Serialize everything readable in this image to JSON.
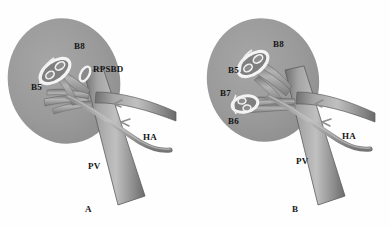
{
  "figure": {
    "background_color": "#fefefe",
    "liver_color": "#9a9a9a",
    "vessel_color": "#8c8c8c",
    "duct_outline_color": "#f2f2f2",
    "label_color": "#151515"
  },
  "panels": [
    {
      "id": "A",
      "letter": "A",
      "labels": [
        {
          "name": "b8",
          "text": "B8",
          "x": 74,
          "y": 47
        },
        {
          "name": "rpsbd",
          "text": "RPSBD",
          "x": 93,
          "y": 70
        },
        {
          "name": "b5",
          "text": "B5",
          "x": 31,
          "y": 88
        },
        {
          "name": "ha",
          "text": "HA",
          "x": 143,
          "y": 138
        },
        {
          "name": "pv",
          "text": "PV",
          "x": 88,
          "y": 167
        }
      ]
    },
    {
      "id": "B",
      "letter": "B",
      "labels": [
        {
          "name": "b8",
          "text": "B8",
          "x": 78,
          "y": 45
        },
        {
          "name": "b5",
          "text": "B5",
          "x": 33,
          "y": 71
        },
        {
          "name": "b7",
          "text": "B7",
          "x": 28,
          "y": 94
        },
        {
          "name": "b6",
          "text": "B6",
          "x": 33,
          "y": 121
        },
        {
          "name": "ha",
          "text": "HA",
          "x": 147,
          "y": 137
        },
        {
          "name": "pv",
          "text": "PV",
          "x": 101,
          "y": 161
        }
      ]
    }
  ]
}
